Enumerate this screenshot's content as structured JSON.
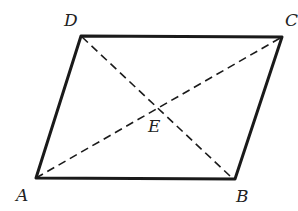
{
  "figure": {
    "type": "parallelogram",
    "vertices": {
      "A": {
        "label": "A",
        "x": 36,
        "y": 178
      },
      "B": {
        "label": "B",
        "x": 235,
        "y": 179
      },
      "C": {
        "label": "C",
        "x": 282,
        "y": 37
      },
      "D": {
        "label": "D",
        "x": 81,
        "y": 36
      }
    },
    "intersection": {
      "label": "E",
      "x": 158,
      "y": 107
    },
    "sides": [
      "AB",
      "BC",
      "CD",
      "DA"
    ],
    "diagonals": [
      "AC",
      "BD"
    ],
    "colors": {
      "stroke": "#1a1a1a",
      "background": "#ffffff"
    }
  }
}
